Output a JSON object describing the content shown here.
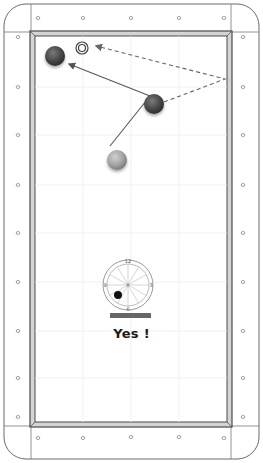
{
  "table": {
    "rail_diamonds": {
      "top": [
        [
          38,
          18
        ],
        [
          83,
          18
        ],
        [
          131,
          18
        ],
        [
          179,
          18
        ],
        [
          224,
          18
        ]
      ],
      "bottom": [
        [
          38,
          438
        ],
        [
          83,
          438
        ],
        [
          131,
          437
        ],
        [
          179,
          437
        ],
        [
          224,
          438
        ]
      ],
      "left": [
        [
          18,
          37
        ],
        [
          18,
          87
        ],
        [
          18,
          135
        ],
        [
          18,
          185
        ],
        [
          18,
          233
        ],
        [
          18,
          282
        ],
        [
          18,
          331
        ],
        [
          18,
          378
        ],
        [
          18,
          417
        ]
      ],
      "right": [
        [
          243,
          37
        ],
        [
          243,
          87
        ],
        [
          243,
          135
        ],
        [
          243,
          185
        ],
        [
          243,
          233
        ],
        [
          243,
          282
        ],
        [
          243,
          331
        ],
        [
          243,
          378
        ],
        [
          243,
          417
        ]
      ]
    },
    "colors": {
      "frame_line": "#555555",
      "cushion": "#d9d9d9",
      "felt": "#ffffff",
      "grid": "#eeeeee"
    }
  },
  "balls": [
    {
      "id": "red-ball-top-left",
      "x": 55,
      "y": 56,
      "r": 10,
      "color": "#5a5a5a"
    },
    {
      "id": "red-ball-center",
      "x": 154,
      "y": 104,
      "r": 10,
      "color": "#555555"
    },
    {
      "id": "cue-ball",
      "x": 117,
      "y": 160,
      "r": 10,
      "color": "#a8a8a8"
    }
  ],
  "target_marker": {
    "x": 82,
    "y": 48,
    "r_outer": 6,
    "r_inner": 3.5
  },
  "paths": {
    "solid": [
      {
        "from": [
          110,
          145
        ],
        "to": [
          150,
          95
        ]
      },
      {
        "from": [
          150,
          95
        ],
        "to": [
          69,
          64
        ],
        "arrow": true
      }
    ],
    "dashed": [
      {
        "from": [
          164,
          102
        ],
        "to": [
          225,
          79
        ]
      },
      {
        "from": [
          225,
          79
        ],
        "to": [
          96,
          46
        ],
        "arrow": true
      }
    ]
  },
  "spin_indicator": {
    "cx": 128,
    "cy": 285,
    "r": 25,
    "labels": {
      "top": "12",
      "right": "3",
      "bottom": "6",
      "left": "9"
    },
    "dot": {
      "x": 118,
      "y": 295,
      "r": 4
    },
    "power_bar": {
      "x": 110,
      "y": 313,
      "w": 41,
      "h": 5,
      "color": "#666666"
    }
  },
  "result": {
    "text": "Yes !"
  }
}
